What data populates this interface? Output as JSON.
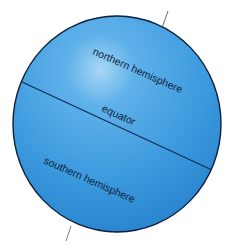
{
  "diagram": {
    "type": "globe-hemispheres",
    "labels": {
      "northern": "northern hemisphere",
      "equator": "equator",
      "southern": "southern hemisphere"
    },
    "colors": {
      "globe_fill": "#3d9be0",
      "globe_highlight": "#9fd0f2",
      "globe_outline": "#0d1f3a",
      "equator_line": "#0d2a4a",
      "axis_line": "#6a6a6a",
      "text": "#0d1f3a"
    }
  }
}
